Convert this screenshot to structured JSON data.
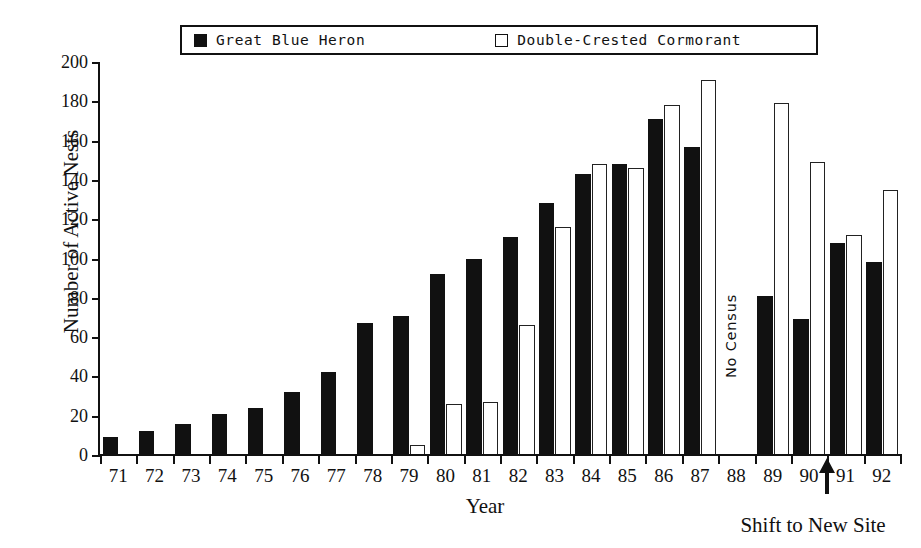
{
  "legend": {
    "entries": [
      {
        "label": "Great Blue Heron",
        "style": "filled"
      },
      {
        "label": "Double-Crested Cormorant",
        "style": "hollow"
      }
    ]
  },
  "annotations": {
    "no_census": "No Census",
    "shift_to_new_site": "Shift to New Site",
    "shift_marker_year": "90/91"
  },
  "colors": {
    "heron": "#111111",
    "cormorant": "#ffffff",
    "outline": "#111111",
    "background": "#ffffff"
  },
  "chart_data": {
    "type": "bar",
    "title": "",
    "xlabel": "Year",
    "ylabel": "Number of Active Nests",
    "ylim": [
      0,
      200
    ],
    "yticks": [
      0,
      20,
      40,
      60,
      80,
      100,
      120,
      140,
      160,
      180,
      200
    ],
    "grid": false,
    "legend_position": "top",
    "categories": [
      "71",
      "72",
      "73",
      "74",
      "75",
      "76",
      "77",
      "78",
      "79",
      "80",
      "81",
      "82",
      "83",
      "84",
      "85",
      "86",
      "87",
      "88",
      "89",
      "90",
      "91",
      "92"
    ],
    "series": [
      {
        "name": "Great Blue Heron",
        "values": [
          9,
          12,
          16,
          21,
          24,
          32,
          42,
          67,
          71,
          92,
          100,
          111,
          128,
          143,
          148,
          171,
          157,
          null,
          81,
          69,
          108,
          98
        ]
      },
      {
        "name": "Double-Crested Cormorant",
        "values": [
          null,
          null,
          null,
          null,
          null,
          null,
          null,
          null,
          5,
          26,
          27,
          66,
          116,
          148,
          146,
          178,
          191,
          null,
          179,
          149,
          112,
          135
        ]
      }
    ],
    "notes": [
      {
        "category": "88",
        "text": "No Census"
      },
      {
        "between": [
          "90",
          "91"
        ],
        "text": "Shift to New Site"
      }
    ]
  }
}
